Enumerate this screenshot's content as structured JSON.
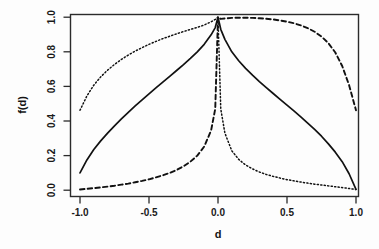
{
  "chart_data": {
    "type": "line",
    "title": "",
    "xlabel": "d",
    "ylabel": "f(d)",
    "xlim": [
      -1.0,
      1.0
    ],
    "ylim": [
      0.0,
      1.0
    ],
    "grid": false,
    "legend": "none",
    "x_ticks": [
      -1.0,
      -0.5,
      0.0,
      0.5,
      1.0
    ],
    "x_tick_labels": [
      "-1.0",
      "-0.5",
      "0.0",
      "0.5",
      "1.0"
    ],
    "y_ticks": [
      0.0,
      0.2,
      0.4,
      0.6,
      0.8,
      1.0
    ],
    "y_tick_labels": [
      "0.0",
      "0.2",
      "0.4",
      "0.6",
      "0.8",
      "1.0"
    ],
    "x": [
      -1.0,
      -0.95,
      -0.9,
      -0.85,
      -0.8,
      -0.75,
      -0.7,
      -0.65,
      -0.6,
      -0.55,
      -0.5,
      -0.45,
      -0.4,
      -0.35,
      -0.3,
      -0.25,
      -0.2,
      -0.15,
      -0.1,
      -0.05,
      -0.02,
      0.0,
      0.02,
      0.05,
      0.1,
      0.15,
      0.2,
      0.25,
      0.3,
      0.35,
      0.4,
      0.45,
      0.5,
      0.55,
      0.6,
      0.65,
      0.7,
      0.75,
      0.8,
      0.85,
      0.9,
      0.95,
      1.0
    ],
    "series": [
      {
        "name": "solid-curve",
        "style": "solid",
        "values": [
          0.1,
          0.175,
          0.235,
          0.285,
          0.33,
          0.372,
          0.412,
          0.45,
          0.487,
          0.522,
          0.557,
          0.591,
          0.625,
          0.658,
          0.692,
          0.726,
          0.762,
          0.8,
          0.843,
          0.898,
          0.94,
          1.0,
          0.93,
          0.872,
          0.8,
          0.748,
          0.704,
          0.665,
          0.628,
          0.593,
          0.559,
          0.525,
          0.492,
          0.458,
          0.424,
          0.388,
          0.351,
          0.312,
          0.268,
          0.22,
          0.165,
          0.095,
          0.005
        ]
      },
      {
        "name": "dotted-curve",
        "style": "dotted",
        "values": [
          0.462,
          0.545,
          0.607,
          0.655,
          0.694,
          0.727,
          0.756,
          0.781,
          0.804,
          0.824,
          0.843,
          0.86,
          0.876,
          0.89,
          0.904,
          0.917,
          0.929,
          0.941,
          0.955,
          0.973,
          0.987,
          1.0,
          0.47,
          0.33,
          0.228,
          0.178,
          0.146,
          0.123,
          0.105,
          0.091,
          0.08,
          0.07,
          0.061,
          0.054,
          0.047,
          0.041,
          0.035,
          0.03,
          0.025,
          0.02,
          0.015,
          0.01,
          0.004
        ]
      },
      {
        "name": "dashed-curve",
        "style": "dashed",
        "values": [
          0.004,
          0.008,
          0.012,
          0.016,
          0.021,
          0.026,
          0.032,
          0.038,
          0.046,
          0.054,
          0.063,
          0.074,
          0.086,
          0.1,
          0.117,
          0.138,
          0.165,
          0.2,
          0.252,
          0.345,
          0.47,
          1.0,
          0.99,
          0.993,
          0.996,
          0.997,
          0.997,
          0.996,
          0.994,
          0.991,
          0.987,
          0.981,
          0.974,
          0.965,
          0.953,
          0.937,
          0.916,
          0.888,
          0.85,
          0.796,
          0.718,
          0.607,
          0.462
        ]
      }
    ]
  }
}
